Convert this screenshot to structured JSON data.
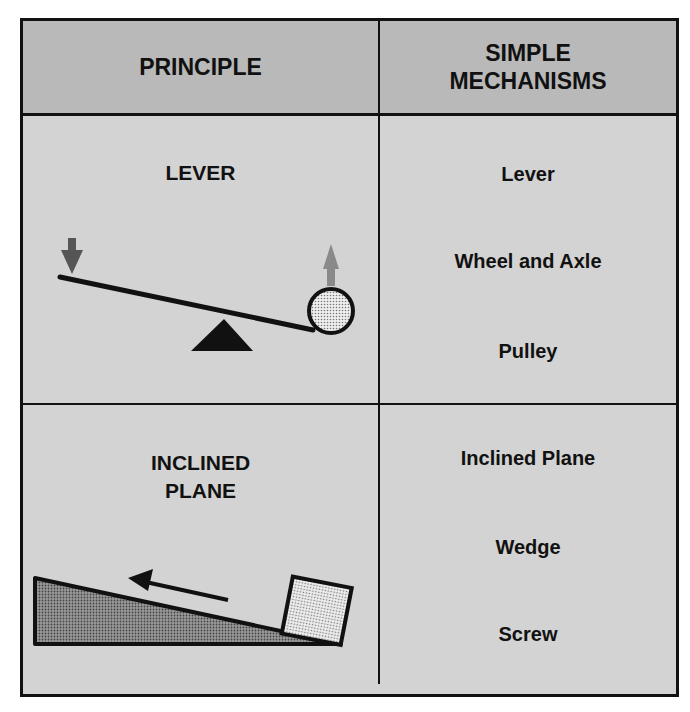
{
  "header": {
    "col1": "PRINCIPLE",
    "col2_line1": "SIMPLE",
    "col2_line2": "MECHANISMS"
  },
  "rows": [
    {
      "principle": "LEVER",
      "mechanisms": [
        "Lever",
        "Wheel and Axle",
        "Pulley"
      ],
      "illustration": "lever-diagram"
    },
    {
      "principle_line1": "INCLINED",
      "principle_line2": "PLANE",
      "mechanisms": [
        "Inclined Plane",
        "Wedge",
        "Screw"
      ],
      "illustration": "inclined-plane-diagram"
    }
  ],
  "colors": {
    "header_bg": "#b9b9b9",
    "cell_bg": "#d3d3d3",
    "line": "#111111",
    "down_arrow": "#555555",
    "up_arrow": "#8a8a8a"
  }
}
